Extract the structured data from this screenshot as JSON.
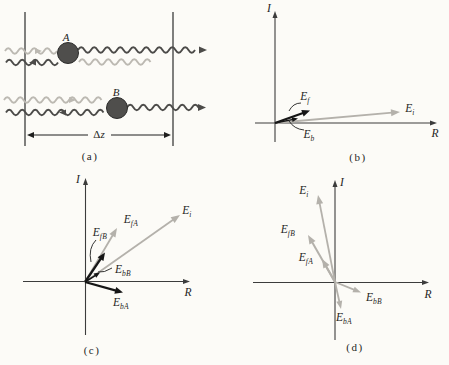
{
  "colors": {
    "background": "#fcfbf7",
    "ink": "#1f1f1e",
    "dark_wave": "#4c4b49",
    "light_wave": "#bcb9b2",
    "black_vector": "#161616",
    "gray_vector": "#b4b1ab",
    "axis": "#3c3c3c",
    "particle_fill": "#4f4e4c",
    "particle_stroke": "#2c2c2b"
  },
  "panel_a": {
    "caption": "(a)",
    "particle_a_label": "A",
    "particle_b_label": "B",
    "borders": [
      {
        "x": 25,
        "y1": 12,
        "y2": 146
      },
      {
        "x": 173,
        "y1": 12,
        "y2": 146
      }
    ],
    "particles": [
      {
        "name": "particle-A",
        "cx": 68,
        "cy": 53,
        "r": 10.5
      },
      {
        "name": "particle-B",
        "cx": 117,
        "cy": 108,
        "r": 10.5
      }
    ],
    "waves": [
      {
        "name": "incident-wave-A",
        "color": "light",
        "y": 51,
        "x1": 5,
        "x2": 62,
        "mid_arrow": {
          "x": 38,
          "dir": "right"
        }
      },
      {
        "name": "forward-wave-A",
        "color": "dark",
        "y": 50,
        "x1": 78,
        "x2": 201,
        "end_arrow": "right"
      },
      {
        "name": "back-wave-A",
        "color": "dark",
        "y": 62.5,
        "x1": 6,
        "x2": 58,
        "mid_arrow": {
          "x": 33,
          "dir": "left"
        }
      },
      {
        "name": "passed-wave-A",
        "color": "light",
        "y": 62,
        "x1": 79,
        "x2": 152
      },
      {
        "name": "incident-wave-B",
        "color": "light",
        "y": 100,
        "x1": 4,
        "x2": 107,
        "mid_arrow": {
          "x": 72,
          "dir": "right"
        }
      },
      {
        "name": "forward-wave-B",
        "color": "dark",
        "y": 107.5,
        "x1": 127,
        "x2": 200,
        "end_arrow": "right"
      },
      {
        "name": "back-wave-B",
        "color": "dark",
        "y": 112.5,
        "x1": 6,
        "x2": 107,
        "mid_arrow": {
          "x": 63,
          "dir": "left"
        }
      }
    ],
    "dimension": {
      "symbol": "Δ",
      "variable": "z",
      "y": 135,
      "x1": 27,
      "x2": 171,
      "gap": [
        88,
        111
      ],
      "label_pos": [
        99,
        134
      ]
    }
  },
  "panel_b": {
    "caption": "(b)",
    "origin": [
      275,
      123
    ],
    "axes": {
      "vx": 275,
      "v_top": 11,
      "v_bottom": 142,
      "hy": 123,
      "h_left": 255,
      "h_right": 437,
      "i_label": "I",
      "r_label": "R",
      "i_pos": [
        269,
        8
      ],
      "r_pos": [
        435,
        133
      ]
    },
    "vectors": [
      {
        "id": "Ei",
        "main": "E",
        "sub": "i",
        "to": [
          400,
          112
        ],
        "color": "gray",
        "w": 1.8,
        "head": [
          9,
          7
        ],
        "label_pos": [
          410,
          109
        ]
      },
      {
        "id": "Eb",
        "main": "E",
        "sub": "b",
        "to": [
          298,
          118.5
        ],
        "color": "black",
        "w": 1.5,
        "head": [
          6,
          5
        ],
        "label_pos": [
          309,
          135
        ]
      },
      {
        "id": "Ef",
        "main": "E",
        "sub": "f",
        "to": [
          310,
          110.5
        ],
        "color": "black",
        "w": 2.3,
        "head": [
          8,
          7
        ],
        "label_pos": [
          305,
          97
        ]
      }
    ],
    "leaders": [
      {
        "name": "Ef-leader",
        "from": [
          301,
          103
        ],
        "ctrl": [
          293,
          103
        ],
        "to": [
          289,
          111
        ]
      },
      {
        "name": "Eb-leader",
        "from": [
          304,
          130
        ],
        "ctrl": [
          294,
          129
        ],
        "to": [
          289,
          121
        ]
      }
    ]
  },
  "panel_c": {
    "caption": "(c)",
    "origin": [
      85,
      282
    ],
    "axes": {
      "vx": 85.5,
      "v_top": 178,
      "v_bottom": 335,
      "hy": 281.5,
      "h_left": 23,
      "h_right": 190,
      "i_label": "I",
      "r_label": "R",
      "i_pos": [
        78,
        179
      ],
      "r_pos": [
        188,
        292
      ]
    },
    "vectors": [
      {
        "id": "Ei",
        "main": "E",
        "sub": "i",
        "to": [
          180,
          215
        ],
        "color": "gray",
        "w": 1.8,
        "head": [
          9,
          7
        ],
        "label_pos": [
          187,
          211
        ]
      },
      {
        "id": "EfA",
        "main": "E",
        "sub": "fA",
        "to": [
          117,
          228
        ],
        "color": "gray",
        "w": 1.8,
        "head": [
          9,
          7
        ],
        "label_pos": [
          131,
          220
        ]
      },
      {
        "id": "EbB",
        "main": "E",
        "sub": "bB",
        "to": [
          100,
          272.5
        ],
        "color": "black",
        "w": 1.5,
        "head": [
          6,
          5
        ],
        "label_pos": [
          123,
          270
        ]
      },
      {
        "id": "EfB",
        "main": "E",
        "sub": "fB",
        "to": [
          105,
          252.5
        ],
        "color": "black",
        "w": 2.3,
        "head": [
          8,
          7
        ],
        "label_pos": [
          100,
          233
        ]
      },
      {
        "id": "EbA",
        "main": "E",
        "sub": "bA",
        "to": [
          123,
          292.5
        ],
        "color": "black",
        "w": 2.3,
        "head": [
          8,
          7
        ],
        "label_pos": [
          121,
          303
        ]
      }
    ],
    "leaders": [
      {
        "name": "EfB-leader",
        "from": [
          96,
          240
        ],
        "ctrl": [
          88,
          248
        ],
        "to": [
          91,
          262
        ]
      },
      {
        "name": "EbB-leader",
        "from": [
          112,
          268
        ],
        "ctrl": [
          104,
          273
        ],
        "to": [
          98,
          272
        ]
      }
    ]
  },
  "panel_d": {
    "caption": "(d)",
    "origin": [
      335,
      282
    ],
    "axes": {
      "vx": 335,
      "v_top": 180,
      "v_bottom": 340,
      "hy": 282.5,
      "h_left": 253,
      "h_right": 429,
      "i_label": "I",
      "r_label": "R",
      "i_pos": [
        342,
        182
      ],
      "r_pos": [
        428,
        294
      ]
    },
    "vectors": [
      {
        "id": "Ei",
        "main": "E",
        "sub": "i",
        "to": [
          318,
          195
        ],
        "color": "gray",
        "w": 1.8,
        "head": [
          9,
          7
        ],
        "label_pos": [
          304,
          191
        ]
      },
      {
        "id": "EfB",
        "main": "E",
        "sub": "fB",
        "to": [
          308,
          235
        ],
        "color": "gray",
        "w": 2.0,
        "head": [
          9,
          7
        ],
        "label_pos": [
          288,
          230
        ]
      },
      {
        "id": "EfA",
        "main": "E",
        "sub": "fA",
        "to": [
          322,
          259
        ],
        "color": "gray",
        "w": 2.0,
        "head": [
          9,
          7
        ],
        "label_pos": [
          306,
          258
        ]
      },
      {
        "id": "EbB",
        "main": "E",
        "sub": "bB",
        "to": [
          361,
          292.5
        ],
        "color": "gray",
        "w": 1.8,
        "head": [
          8,
          6
        ],
        "label_pos": [
          374,
          298
        ]
      },
      {
        "id": "EbA",
        "main": "E",
        "sub": "bA",
        "to": [
          341,
          309
        ],
        "color": "gray",
        "w": 1.8,
        "head": [
          8,
          6
        ],
        "label_pos": [
          344,
          318
        ]
      }
    ],
    "leaders": []
  }
}
